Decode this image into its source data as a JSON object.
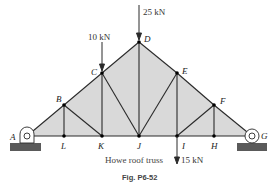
{
  "diagram": {
    "caption": "Howe roof truss",
    "figure_label": "Fig. P6-52",
    "colors": {
      "fill": "#d9d9d9",
      "member": "#2a2a2a",
      "ground": "#5a5a5a",
      "node": "#000000"
    },
    "nodes": [
      {
        "id": "A",
        "label": "A",
        "x": 27,
        "y": 136
      },
      {
        "id": "B",
        "label": "B",
        "x": 64,
        "y": 105
      },
      {
        "id": "C",
        "label": "C",
        "x": 102,
        "y": 73
      },
      {
        "id": "D",
        "label": "D",
        "x": 139,
        "y": 42
      },
      {
        "id": "E",
        "label": "E",
        "x": 177,
        "y": 73
      },
      {
        "id": "F",
        "label": "F",
        "x": 214,
        "y": 105
      },
      {
        "id": "G",
        "label": "G",
        "x": 252,
        "y": 136
      },
      {
        "id": "H",
        "label": "H",
        "x": 214,
        "y": 136
      },
      {
        "id": "I",
        "label": "I",
        "x": 177,
        "y": 136
      },
      {
        "id": "J",
        "label": "J",
        "x": 139,
        "y": 136
      },
      {
        "id": "K",
        "label": "K",
        "x": 102,
        "y": 136
      },
      {
        "id": "L",
        "label": "L",
        "x": 64,
        "y": 136
      }
    ],
    "members": [
      [
        "A",
        "B"
      ],
      [
        "B",
        "C"
      ],
      [
        "C",
        "D"
      ],
      [
        "D",
        "E"
      ],
      [
        "E",
        "F"
      ],
      [
        "F",
        "G"
      ],
      [
        "A",
        "L"
      ],
      [
        "L",
        "K"
      ],
      [
        "K",
        "J"
      ],
      [
        "J",
        "I"
      ],
      [
        "I",
        "H"
      ],
      [
        "H",
        "G"
      ],
      [
        "B",
        "L"
      ],
      [
        "B",
        "K"
      ],
      [
        "C",
        "K"
      ],
      [
        "C",
        "J"
      ],
      [
        "D",
        "J"
      ],
      [
        "E",
        "J"
      ],
      [
        "E",
        "I"
      ],
      [
        "F",
        "I"
      ],
      [
        "F",
        "H"
      ]
    ],
    "loads": [
      {
        "id": "load-25",
        "label": "25 kN",
        "node": "D",
        "direction": "down"
      },
      {
        "id": "load-10",
        "label": "10 kN",
        "node": "C",
        "direction": "down"
      },
      {
        "id": "load-15",
        "label": "15 kN",
        "node": "I",
        "direction": "down"
      }
    ],
    "supports": [
      {
        "node": "A",
        "type": "pin"
      },
      {
        "node": "G",
        "type": "roller"
      }
    ]
  }
}
